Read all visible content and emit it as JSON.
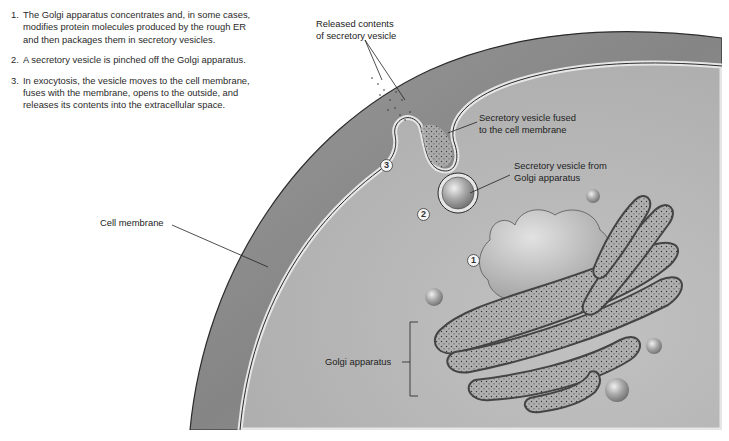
{
  "steps": [
    {
      "num": "1.",
      "text": "The Golgi apparatus concentrates and, in some cases, modifies protein molecules produced by the rough ER and then packages them in secretory vesicles."
    },
    {
      "num": "2.",
      "text": "A secretory vesicle is pinched off the Golgi apparatus."
    },
    {
      "num": "3.",
      "text": "In exocytosis, the vesicle moves to the cell membrane, fuses with the membrane, opens to the outside, and releases its contents into the extracellular space."
    }
  ],
  "labels": {
    "released_contents_line1": "Released contents",
    "released_contents_line2": "of secretory vesicle",
    "fused_line1": "Secretory vesicle fused",
    "fused_line2": "to the cell membrane",
    "from_golgi_line1": "Secretory vesicle from",
    "from_golgi_line2": "Golgi apparatus",
    "cell_membrane": "Cell membrane",
    "golgi_apparatus": "Golgi apparatus"
  },
  "badges": {
    "one": "1",
    "two": "2",
    "three": "3"
  },
  "colors": {
    "cell_outer": "#8c8c8c",
    "cytoplasm": "#b9b9b9",
    "membrane_light": "#e6e6e6",
    "outline": "#2b2b2b"
  }
}
